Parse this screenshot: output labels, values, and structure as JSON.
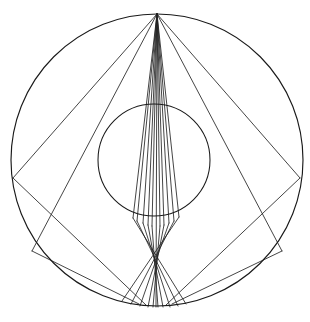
{
  "figure": {
    "canvas": {
      "width": 310,
      "height": 322,
      "background": "#ffffff"
    },
    "stroke_color": "#1a1a1a",
    "ray_color": "#242424",
    "outer_circle": {
      "cx": 157,
      "cy": 160,
      "r": 146,
      "label": "outer-circle"
    },
    "inner_circle": {
      "cx": 154,
      "cy": 160,
      "r": 56,
      "label": "inner-circle"
    },
    "apex": {
      "x": 157,
      "y": 14,
      "label": "apex-point"
    },
    "focus": {
      "x": 155,
      "y": 226,
      "label": "focal-crossing-point"
    }
  },
  "chart_data": {
    "type": "scatter",
    "xlabel": "",
    "ylabel": "",
    "grid": false,
    "legend": "none",
    "xlim": [
      0,
      310
    ],
    "ylim": [
      0,
      322
    ],
    "circles": [
      {
        "name": "outer-circle",
        "cx": 157,
        "cy": 160,
        "r": 146
      },
      {
        "name": "inner-circle",
        "cx": 154,
        "cy": 160,
        "r": 56
      }
    ],
    "points": [
      {
        "name": "apex",
        "x": 157,
        "y": 14
      },
      {
        "name": "focus",
        "x": 155,
        "y": 226
      }
    ],
    "upper_fan_endpoints": [
      {
        "x": 142,
        "y": 222
      },
      {
        "x": 144,
        "y": 223
      },
      {
        "x": 147,
        "y": 224
      },
      {
        "x": 150,
        "y": 225
      },
      {
        "x": 153,
        "y": 226
      },
      {
        "x": 156,
        "y": 226
      },
      {
        "x": 159,
        "y": 226
      },
      {
        "x": 162,
        "y": 225
      },
      {
        "x": 165,
        "y": 224
      },
      {
        "x": 168,
        "y": 223
      },
      {
        "x": 171,
        "y": 221
      },
      {
        "x": 139,
        "y": 220
      },
      {
        "x": 175,
        "y": 219
      },
      {
        "x": 136,
        "y": 218
      },
      {
        "x": 178,
        "y": 216
      }
    ],
    "apex_rays": [
      {
        "name": "ray-L7",
        "x1": 157,
        "y1": 14,
        "x2": 13,
        "y2": 178
      },
      {
        "name": "ray-L6",
        "x1": 157,
        "y1": 14,
        "x2": 32,
        "y2": 251
      },
      {
        "name": "ray-L5",
        "x1": 157,
        "y1": 14,
        "x2": 133,
        "y2": 218
      },
      {
        "name": "ray-L4",
        "x1": 157,
        "y1": 14,
        "x2": 137,
        "y2": 221
      },
      {
        "name": "ray-L3",
        "x1": 157,
        "y1": 14,
        "x2": 143,
        "y2": 223
      },
      {
        "name": "ray-L2",
        "x1": 157,
        "y1": 14,
        "x2": 148,
        "y2": 225
      },
      {
        "name": "ray-L1",
        "x1": 157,
        "y1": 14,
        "x2": 152,
        "y2": 226
      },
      {
        "name": "ray-C0",
        "x1": 157,
        "y1": 14,
        "x2": 156,
        "y2": 307
      },
      {
        "name": "ray-R1",
        "x1": 157,
        "y1": 14,
        "x2": 160,
        "y2": 226
      },
      {
        "name": "ray-R2",
        "x1": 157,
        "y1": 14,
        "x2": 164,
        "y2": 225
      },
      {
        "name": "ray-R3",
        "x1": 157,
        "y1": 14,
        "x2": 169,
        "y2": 223
      },
      {
        "name": "ray-R4",
        "x1": 157,
        "y1": 14,
        "x2": 174,
        "y2": 221
      },
      {
        "name": "ray-R5",
        "x1": 157,
        "y1": 14,
        "x2": 179,
        "y2": 217
      },
      {
        "name": "ray-R6",
        "x1": 157,
        "y1": 14,
        "x2": 282,
        "y2": 251
      },
      {
        "name": "ray-R7",
        "x1": 157,
        "y1": 14,
        "x2": 300,
        "y2": 178
      }
    ],
    "exit_rays": [
      {
        "name": "exit-L7",
        "x1": 13,
        "y1": 178,
        "x2": 146,
        "y2": 305
      },
      {
        "name": "exit-L6",
        "x1": 32,
        "y1": 251,
        "x2": 139,
        "y2": 304
      },
      {
        "name": "exit-L5",
        "x1": 133,
        "y1": 218,
        "x2": 186,
        "y2": 304
      },
      {
        "name": "exit-L4",
        "x1": 137,
        "y1": 221,
        "x2": 178,
        "y2": 306
      },
      {
        "name": "exit-L3",
        "x1": 143,
        "y1": 223,
        "x2": 170,
        "y2": 307
      },
      {
        "name": "exit-L2",
        "x1": 148,
        "y1": 225,
        "x2": 163,
        "y2": 307
      },
      {
        "name": "exit-L1",
        "x1": 152,
        "y1": 226,
        "x2": 158,
        "y2": 307
      },
      {
        "name": "exit-R1",
        "x1": 160,
        "y1": 226,
        "x2": 153,
        "y2": 307
      },
      {
        "name": "exit-R2",
        "x1": 164,
        "y1": 225,
        "x2": 148,
        "y2": 307
      },
      {
        "name": "exit-R3",
        "x1": 169,
        "y1": 223,
        "x2": 140,
        "y2": 306
      },
      {
        "name": "exit-R4",
        "x1": 174,
        "y1": 221,
        "x2": 131,
        "y2": 304
      },
      {
        "name": "exit-R5",
        "x1": 179,
        "y1": 217,
        "x2": 122,
        "y2": 301
      },
      {
        "name": "exit-R6",
        "x1": 282,
        "y1": 251,
        "x2": 172,
        "y2": 304
      },
      {
        "name": "exit-R7",
        "x1": 300,
        "y1": 178,
        "x2": 166,
        "y2": 305
      }
    ]
  }
}
